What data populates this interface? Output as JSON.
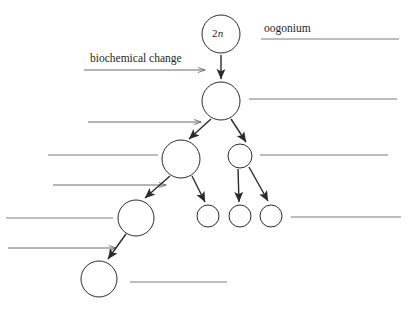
{
  "diagram": {
    "labels": {
      "ploidy_marker": "2n",
      "ploidy_prefix": "2",
      "ploidy_italic": "n",
      "oogonium": "oogonium",
      "biochemical_change": "biochemical change"
    },
    "colors": {
      "cell_outline": "#2b2b2b",
      "branch_arrow": "#2b2b2b",
      "process_arrow": "#6b6b6b",
      "answer_rule": "#7a7a7a",
      "background": "#ffffff",
      "text": "#1f1f1f"
    },
    "cells": [
      {
        "name": "oogonium-cell",
        "cx": 221,
        "cy": 34,
        "r": 19,
        "label": "2n"
      },
      {
        "name": "primary-oocyte-cell",
        "cx": 221,
        "cy": 101,
        "r": 19,
        "label": ""
      },
      {
        "name": "secondary-oocyte-cell",
        "cx": 181,
        "cy": 159,
        "r": 19,
        "label": ""
      },
      {
        "name": "first-polar-body-cell",
        "cx": 240,
        "cy": 156,
        "r": 12,
        "label": ""
      },
      {
        "name": "ootid-cell",
        "cx": 136,
        "cy": 218,
        "r": 18,
        "label": ""
      },
      {
        "name": "polar-body-small-1",
        "cx": 208,
        "cy": 216,
        "r": 11,
        "label": ""
      },
      {
        "name": "polar-body-small-2",
        "cx": 240,
        "cy": 216,
        "r": 11,
        "label": ""
      },
      {
        "name": "polar-body-small-3",
        "cx": 271,
        "cy": 216,
        "r": 11,
        "label": ""
      },
      {
        "name": "ovum-cell",
        "cx": 99,
        "cy": 279,
        "r": 18,
        "label": ""
      }
    ],
    "branch_arrows": [
      {
        "name": "arrow-oogonium-to-primary",
        "x1": 221,
        "y1": 55,
        "x2": 221,
        "y2": 79
      },
      {
        "name": "arrow-primary-to-secondary",
        "x1": 211,
        "y1": 119,
        "x2": 189,
        "y2": 139
      },
      {
        "name": "arrow-primary-to-first-polar",
        "x1": 231,
        "y1": 119,
        "x2": 246,
        "y2": 142
      },
      {
        "name": "arrow-secondary-to-ootid",
        "x1": 170,
        "y1": 176,
        "x2": 145,
        "y2": 198
      },
      {
        "name": "arrow-secondary-to-polar-2",
        "x1": 192,
        "y1": 176,
        "x2": 205,
        "y2": 202
      },
      {
        "name": "arrow-first-polar-to-polar-3",
        "x1": 238,
        "y1": 169,
        "x2": 239,
        "y2": 202
      },
      {
        "name": "arrow-first-polar-to-polar-4",
        "x1": 249,
        "y1": 167,
        "x2": 268,
        "y2": 201
      },
      {
        "name": "arrow-ootid-to-ovum",
        "x1": 126,
        "y1": 234,
        "x2": 108,
        "y2": 259
      }
    ],
    "process_arrows": [
      {
        "name": "process-arrow-biochemical-change",
        "x1": 84,
        "y1": 70,
        "x2": 205,
        "y2": 70
      },
      {
        "name": "process-arrow-meiosis-one",
        "x1": 88,
        "y1": 122,
        "x2": 201,
        "y2": 122
      },
      {
        "name": "process-arrow-meiosis-two",
        "x1": 53,
        "y1": 185,
        "x2": 166,
        "y2": 185
      },
      {
        "name": "process-arrow-maturation",
        "x1": 8,
        "y1": 248,
        "x2": 116,
        "y2": 248
      }
    ],
    "answer_rules": [
      {
        "name": "answer-line-oogonium",
        "x1": 261,
        "y1": 39,
        "x2": 399,
        "y2": 39
      },
      {
        "name": "answer-line-primary-oocyte",
        "x1": 249,
        "y1": 99,
        "x2": 397,
        "y2": 99
      },
      {
        "name": "answer-line-secondary-oocyte-left",
        "x1": 48,
        "y1": 155,
        "x2": 158,
        "y2": 155
      },
      {
        "name": "answer-line-first-polar-body-right",
        "x1": 260,
        "y1": 155,
        "x2": 388,
        "y2": 155
      },
      {
        "name": "answer-line-ootid-left",
        "x1": 6,
        "y1": 218,
        "x2": 113,
        "y2": 218
      },
      {
        "name": "answer-line-polar-bodies-right",
        "x1": 291,
        "y1": 217,
        "x2": 401,
        "y2": 217
      },
      {
        "name": "answer-line-ovum-right",
        "x1": 130,
        "y1": 282,
        "x2": 227,
        "y2": 282
      }
    ],
    "text_positions": {
      "ploidy": {
        "x": 212,
        "y": 27
      },
      "oogonium": {
        "x": 264,
        "y": 22
      },
      "biochemical_change": {
        "x": 90,
        "y": 52
      }
    }
  }
}
